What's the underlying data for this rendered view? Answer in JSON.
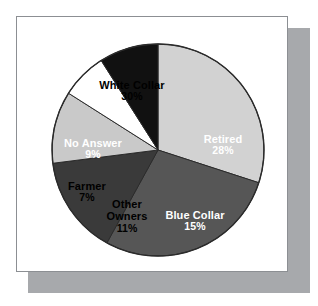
{
  "figure": {
    "background_color": "#ffffff",
    "card_background": "#ffffff",
    "card_border_color": "#8c8f93",
    "shadow_color": "#a7a9ac"
  },
  "chart_data": {
    "type": "pie",
    "title": "",
    "subtitle": "",
    "xlabel": "",
    "ylabel": "",
    "legend_position": "none",
    "labels_inside_slices": true,
    "value_suffix": "%",
    "total": 100,
    "center": {
      "x": 158,
      "y": 150
    },
    "radius": 106,
    "start_angle_deg": 0,
    "direction": "clockwise",
    "categories": [
      "White Collar",
      "Retired",
      "Blue Collar",
      "Other Owners",
      "Farmer",
      "No Answer"
    ],
    "values": [
      30,
      28,
      15,
      11,
      7,
      9
    ],
    "value_labels": [
      "30%",
      "28%",
      "15%",
      "11%",
      "7%",
      "9%"
    ],
    "slice_colors": [
      "#d2d2d2",
      "#565656",
      "#3a3a3a",
      "#c9c9c9",
      "#ffffff",
      "#111111"
    ],
    "slice_text_colors": [
      "#000000",
      "#ffffff",
      "#ffffff",
      "#000000",
      "#000000",
      "#ffffff"
    ],
    "slices": [
      {
        "name": "White Collar",
        "value": 30,
        "value_label": "30%",
        "color": "#d2d2d2",
        "text_color": "#000000",
        "text_tone": "on-light"
      },
      {
        "name": "Retired",
        "value": 28,
        "value_label": "28%",
        "color": "#565656",
        "text_color": "#ffffff",
        "text_tone": "on-dark"
      },
      {
        "name": "Blue Collar",
        "value": 15,
        "value_label": "15%",
        "color": "#3a3a3a",
        "text_color": "#ffffff",
        "text_tone": "on-dark"
      },
      {
        "name": "Other Owners",
        "value": 11,
        "value_label": "11%",
        "color": "#c9c9c9",
        "text_color": "#000000",
        "text_tone": "on-light"
      },
      {
        "name": "Farmer",
        "value": 7,
        "value_label": "7%",
        "color": "#ffffff",
        "text_color": "#000000",
        "text_tone": "on-light"
      },
      {
        "name": "No Answer",
        "value": 9,
        "value_label": "9%",
        "color": "#111111",
        "text_color": "#ffffff",
        "text_tone": "on-dark"
      }
    ]
  },
  "labels": {
    "white_collar": {
      "name": "White Collar",
      "value": "30%"
    },
    "retired": {
      "name": "Retired",
      "value": "28%"
    },
    "blue_collar": {
      "name": "Blue Collar",
      "value": "15%"
    },
    "other_owners_line1": "Other",
    "other_owners_line2": "Owners",
    "other_owners_value": "11%",
    "farmer": {
      "name": "Farmer",
      "value": "7%"
    },
    "no_answer": {
      "name": "No Answer",
      "value": "9%"
    }
  }
}
